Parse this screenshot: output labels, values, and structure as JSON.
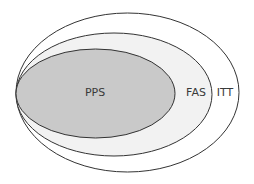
{
  "diagram": {
    "type": "nested-ellipse-venn",
    "sets": [
      {
        "id": "itt",
        "label": "ITT",
        "fill": "#ffffff",
        "stroke": "#333333",
        "cx": 127.5,
        "cy": 92.5,
        "rx": 111.5,
        "ry": 79.5,
        "label_x": 225,
        "label_y": 96
      },
      {
        "id": "fas",
        "label": "FAS",
        "fill": "#f2f2f2",
        "stroke": "#333333",
        "cx": 114,
        "cy": 94.5,
        "rx": 98,
        "ry": 61.5,
        "label_x": 196,
        "label_y": 96
      },
      {
        "id": "pps",
        "label": "PPS",
        "fill": "#c9c9c9",
        "stroke": "#333333",
        "cx": 95.5,
        "cy": 93.5,
        "rx": 79.5,
        "ry": 44.5,
        "label_x": 95,
        "label_y": 96
      }
    ]
  }
}
